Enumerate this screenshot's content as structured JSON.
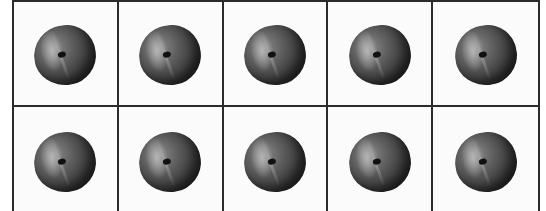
{
  "ten_frame": {
    "rows": 2,
    "columns": 5,
    "cells": [
      {
        "item": "peach"
      },
      {
        "item": "peach"
      },
      {
        "item": "peach"
      },
      {
        "item": "peach"
      },
      {
        "item": "peach"
      },
      {
        "item": "peach"
      },
      {
        "item": "peach"
      },
      {
        "item": "peach"
      },
      {
        "item": "peach"
      },
      {
        "item": "peach"
      }
    ],
    "count": 10,
    "colors": {
      "border": "#2b2b2b",
      "background": "#fbfbfb",
      "fruit": "#3a3a3a"
    }
  }
}
